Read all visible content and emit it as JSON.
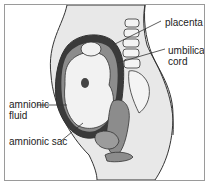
{
  "figure": {
    "labels": {
      "placenta": "placenta",
      "umbilical_cord_line1": "umbilical",
      "umbilical_cord_line2": "cord",
      "amnionic_fluid_line1": "amnionic",
      "amnionic_fluid_line2": "fluid",
      "amnionic_sac": "amnionic sac"
    },
    "colors": {
      "body_fill": "#e6e6e6",
      "uterus_dark": "#3a3a3a",
      "tissue_gray": "#8c8c8c",
      "outline": "#333333",
      "background": "#ffffff"
    }
  }
}
